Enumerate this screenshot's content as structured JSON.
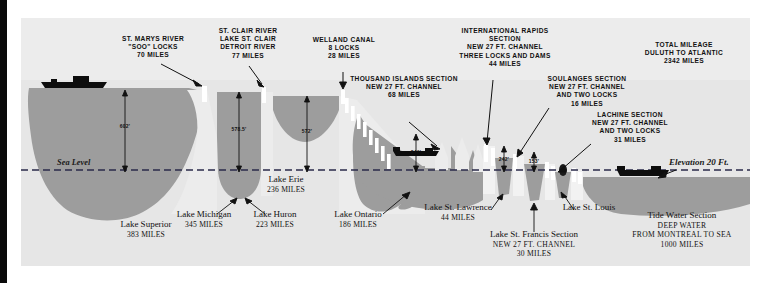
{
  "diagram": {
    "sea_level_label": "Sea Level",
    "elevation_right_label": "Elevation 20 Ft.",
    "panel_bg": "#ececec",
    "water_color": "#9a9a9a",
    "land_color": "#e3e3e3"
  },
  "callouts": [
    {
      "name": "st-marys-river",
      "lines": [
        "ST. MARYS RIVER",
        "\"SOO\" LOCKS",
        "70 MILES"
      ]
    },
    {
      "name": "st-clair-river",
      "lines": [
        "ST. CLAIR RIVER",
        "LAKE ST. CLAIR",
        "DETROIT RIVER",
        "77 MILES"
      ]
    },
    {
      "name": "welland-canal",
      "lines": [
        "WELLAND CANAL",
        "8 LOCKS",
        "28 MILES"
      ]
    },
    {
      "name": "thousand-islands-section",
      "lines": [
        "THOUSAND ISLANDS SECTION",
        "NEW 27 FT. CHANNEL",
        "68 MILES"
      ]
    },
    {
      "name": "international-rapids-section",
      "lines": [
        "INTERNATIONAL RAPIDS",
        "SECTION",
        "NEW 27 FT. CHANNEL",
        "THREE LOCKS AND DAMS",
        "44 MILES"
      ]
    },
    {
      "name": "soulanges-section",
      "lines": [
        "SOULANGES SECTION",
        "NEW 27 FT. CHANNEL",
        "AND TWO LOCKS",
        "16 MILES"
      ]
    },
    {
      "name": "lachine-section",
      "lines": [
        "LACHINE SECTION",
        "NEW 27 FT. CHANNEL",
        "AND TWO LOCKS",
        "31 MILES"
      ]
    },
    {
      "name": "total-mileage",
      "lines": [
        "TOTAL MILEAGE",
        "DULUTH TO ATLANTIC",
        "2342 MILES"
      ]
    }
  ],
  "lakes": [
    {
      "name": "lake-superior",
      "label": "Lake Superior",
      "miles": "383  MILES"
    },
    {
      "name": "lake-michigan",
      "label": "Lake Michigan",
      "miles": "345  MILES"
    },
    {
      "name": "lake-huron",
      "label": "Lake Huron",
      "miles": "223  MILES"
    },
    {
      "name": "lake-erie",
      "label": "Lake Erie",
      "miles": "236  MILES"
    },
    {
      "name": "lake-ontario",
      "label": "Lake Ontario",
      "miles": "186  MILES"
    },
    {
      "name": "lake-st-lawrence",
      "label": "Lake St. Lawrence",
      "miles": "44  MILES"
    },
    {
      "name": "lake-st-louis",
      "label": "Lake St. Louis",
      "miles": ""
    }
  ],
  "sections_serif": [
    {
      "name": "lake-st-francis-section",
      "title": "Lake St. Francis Section",
      "l1": "NEW  27  FT.  CHANNEL",
      "l2": "30  MILES"
    },
    {
      "name": "tide-water-section",
      "title": "Tide Water Section",
      "l1": "DEEP  WATER",
      "l2": "FROM  MONTREAL  TO  SEA",
      "l3": "1000  MILES"
    }
  ],
  "elevations": [
    {
      "name": "elev-lake-superior",
      "value": "602'"
    },
    {
      "name": "elev-lake-michigan-huron",
      "value": "578.5'"
    },
    {
      "name": "elev-lake-erie",
      "value": "572'"
    },
    {
      "name": "elev-lake-ontario",
      "value": "246'"
    },
    {
      "name": "elev-lake-st-lawrence",
      "value": "242'"
    },
    {
      "name": "elev-lake-st-francis",
      "value": "153'"
    }
  ]
}
